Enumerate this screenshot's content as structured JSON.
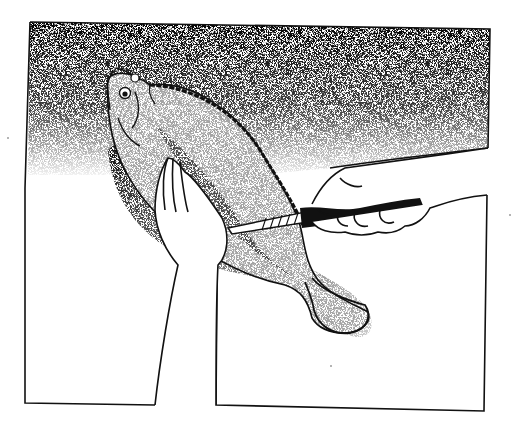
{
  "illustration": {
    "subject": "Hands filleting a flatfish with a knife",
    "style": "black-and-white stipple and line drawing",
    "colors": {
      "background": "#ffffff",
      "ink": "#111111",
      "stipple": "#2a2a2a"
    },
    "elements": [
      "frame-border",
      "stippled-backdrop",
      "flatfish",
      "fish-head",
      "fish-eye",
      "dorsal-fin-edge",
      "fillet-cut",
      "tail-fin",
      "left-hand-holding-fish",
      "right-hand-holding-knife",
      "fillet-knife"
    ]
  }
}
